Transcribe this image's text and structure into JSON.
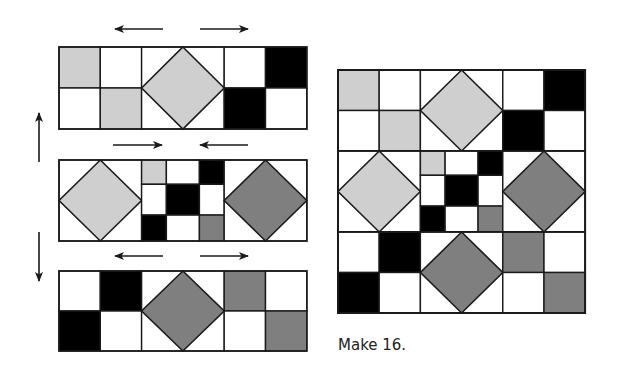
{
  "caption": "Make 16.",
  "colors": {
    "light": "#cfcfcf",
    "dark": "#7f7f7f",
    "black": "#000000",
    "white": "#ffffff",
    "line": "#1a1a1a"
  },
  "rows": [
    {
      "name": "top-row",
      "type": "strip",
      "cells": [
        [
          "light",
          "white"
        ],
        [
          "white",
          "light"
        ],
        "diamond-light",
        [
          "white",
          "black"
        ],
        [
          "black",
          "white"
        ]
      ],
      "pressing_arrows": [
        "left",
        "right"
      ]
    },
    {
      "name": "middle-row",
      "type": "strip",
      "cells": [
        "diamond-light",
        "nine-patch",
        "diamond-dark"
      ],
      "nine_patch": [
        [
          "light",
          "white",
          "black"
        ],
        [
          "white",
          "black",
          "white"
        ],
        [
          "black",
          "white",
          "dark"
        ]
      ],
      "pressing_arrows": [
        "right",
        "left"
      ]
    },
    {
      "name": "bottom-row",
      "type": "strip",
      "cells": [
        [
          "white",
          "black"
        ],
        [
          "black",
          "white"
        ],
        "diamond-dark",
        [
          "dark",
          "white"
        ],
        [
          "white",
          "dark"
        ]
      ],
      "pressing_arrows": [
        "left",
        "right"
      ]
    }
  ],
  "seam_arrows": [
    "up",
    "down"
  ]
}
